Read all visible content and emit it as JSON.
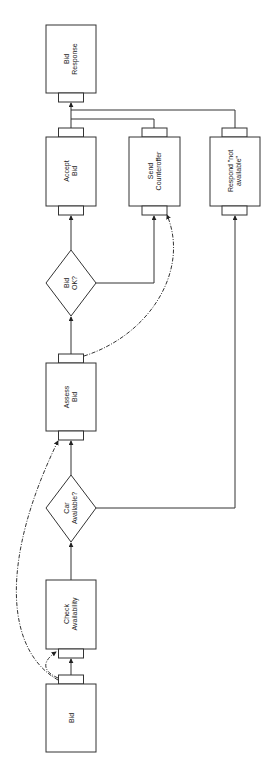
{
  "diagram": {
    "type": "flowchart",
    "orientation": "rotated-90-ccw",
    "colors": {
      "stroke": "#333333",
      "background": "#ffffff",
      "text": "#222222"
    },
    "nodes": [
      {
        "id": "bid",
        "shape": "process",
        "lines": [
          "Bid"
        ]
      },
      {
        "id": "check_availability",
        "shape": "process",
        "lines": [
          "Check",
          "Availability"
        ]
      },
      {
        "id": "car_available",
        "shape": "decision",
        "lines": [
          "Car",
          "Available?"
        ]
      },
      {
        "id": "assess_bid",
        "shape": "process",
        "lines": [
          "Assess",
          "Bid"
        ]
      },
      {
        "id": "bid_ok",
        "shape": "decision",
        "lines": [
          "Bid",
          "OK?"
        ]
      },
      {
        "id": "accept_bid",
        "shape": "process",
        "lines": [
          "Accept",
          "Bid"
        ]
      },
      {
        "id": "send_counteroffer",
        "shape": "process",
        "lines": [
          "Send",
          "Counteroffer"
        ]
      },
      {
        "id": "respond_not_available",
        "shape": "process",
        "lines": [
          "Respond \"not",
          "available\""
        ]
      },
      {
        "id": "bid_response",
        "shape": "process",
        "lines": [
          "Bid",
          "Response"
        ]
      }
    ],
    "edges": [
      {
        "from": "bid",
        "to": "check_availability",
        "style": "solid"
      },
      {
        "from": "check_availability",
        "to": "car_available",
        "style": "solid"
      },
      {
        "from": "car_available",
        "to": "assess_bid",
        "style": "solid"
      },
      {
        "from": "car_available",
        "to": "respond_not_available",
        "style": "solid"
      },
      {
        "from": "assess_bid",
        "to": "bid_ok",
        "style": "solid"
      },
      {
        "from": "bid_ok",
        "to": "accept_bid",
        "style": "solid"
      },
      {
        "from": "bid_ok",
        "to": "send_counteroffer",
        "style": "solid"
      },
      {
        "from": "accept_bid",
        "to": "bid_response",
        "style": "solid"
      },
      {
        "from": "send_counteroffer",
        "to": "bid_response",
        "style": "solid"
      },
      {
        "from": "respond_not_available",
        "to": "bid_response",
        "style": "solid"
      },
      {
        "from": "bid",
        "to": "check_availability",
        "style": "dash-dot"
      },
      {
        "from": "bid",
        "to": "assess_bid",
        "style": "dash-dot"
      },
      {
        "from": "assess_bid",
        "to": "send_counteroffer",
        "style": "dash-dot"
      }
    ]
  }
}
